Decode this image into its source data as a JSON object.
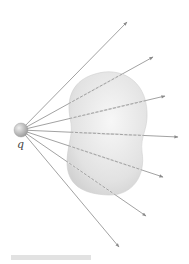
{
  "figure": {
    "charge": {
      "label": "q",
      "cx": 21,
      "cy": 130,
      "r": 7,
      "color": "#b8b8b8"
    },
    "surface": {
      "description": "closed irregular surface",
      "fill": "#e4e4e4",
      "stroke": "#cfcfcf"
    },
    "field_lines": [
      {
        "x2": 127,
        "y2": 22
      },
      {
        "x2": 153,
        "y2": 57
      },
      {
        "x2": 165,
        "y2": 96
      },
      {
        "x2": 178,
        "y2": 137
      },
      {
        "x2": 163,
        "y2": 177
      },
      {
        "x2": 146,
        "y2": 216
      },
      {
        "x2": 119,
        "y2": 247
      }
    ],
    "line_color": "#8a8a8a"
  },
  "caption": {
    "text": ""
  }
}
